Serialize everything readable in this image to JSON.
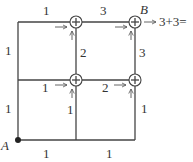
{
  "diagram": {
    "type": "grid-path-counting",
    "points": {
      "A": {
        "label": "A"
      },
      "B": {
        "label": "B"
      }
    },
    "edge_labels": {
      "top_left": "1",
      "top_right": "3",
      "left_upper": "1",
      "left_lower": "1",
      "mid_vertical_upper": "2",
      "right_vertical_upper": "3",
      "mid_horizontal_left": "1",
      "mid_horizontal_right": "2",
      "mid_vertical_lower": "1",
      "right_vertical_lower": "1",
      "bottom_left": "1",
      "bottom_right": "1"
    },
    "result_expression": "→ 3 + 3 =",
    "node_symbol": "+",
    "colors": {
      "stroke": "#444444",
      "text": "#333333",
      "background": "#ffffff"
    }
  }
}
